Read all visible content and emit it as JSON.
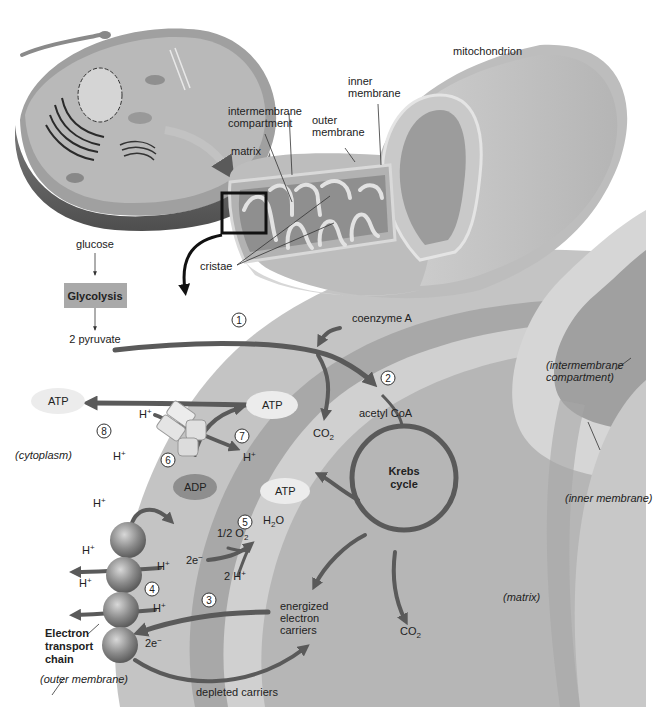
{
  "figure": {
    "colors": {
      "background": "#ffffff",
      "cytoplasm_band": "#c4c4c4",
      "outer_membrane_band": "#a8a8a8",
      "intermembrane_band": "#cfcfcf",
      "matrix": "#b4b4b4",
      "arrow": "#5a5a5a",
      "atp_oval": "#ececec",
      "adp_oval": "#8e8e8e",
      "glycolysis_box": "#a9a9a9"
    }
  },
  "mitochondrion_labels": {
    "mitochondrion": "mitochondrion",
    "inner_membrane_1": "inner",
    "inner_membrane_2": "membrane",
    "outer_membrane_1": "outer",
    "outer_membrane_2": "membrane",
    "intermembrane_1": "intermembrane",
    "intermembrane_2": "compartment",
    "matrix": "matrix",
    "cristae": "cristae"
  },
  "glycolysis": {
    "input": "glucose",
    "box_label": "Glycolysis",
    "output": "2 pyruvate"
  },
  "steps": [
    "1",
    "2",
    "3",
    "4",
    "5",
    "6",
    "7",
    "8"
  ],
  "pathway_labels": {
    "coenzyme_a": "coenzyme A",
    "acetyl_coa": "acetyl CoA",
    "co2": "CO",
    "co2_sub": "2",
    "krebs_1": "Krebs",
    "krebs_2": "cycle",
    "atp": "ATP",
    "adp": "ADP",
    "h_plus": "H",
    "h_sup": "+",
    "two_h_plus": "2 H",
    "half_o2": "1/2 O",
    "o2_sub": "2",
    "h2o_h": "H",
    "h2o_sub": "2",
    "h2o_o": "O",
    "two_e": "2e",
    "e_sup": "−",
    "energized_1": "energized",
    "energized_2": "electron",
    "energized_3": "carriers",
    "depleted": "depleted carriers",
    "etc_1": "Electron",
    "etc_2": "transport",
    "etc_3": "chain"
  },
  "region_labels": {
    "cytoplasm": "(cytoplasm)",
    "outer_membrane": "(outer membrane)",
    "intermembrane_1": "(intermembrane",
    "intermembrane_2": "compartment)",
    "inner_membrane": "(inner membrane)",
    "matrix": "(matrix)"
  }
}
